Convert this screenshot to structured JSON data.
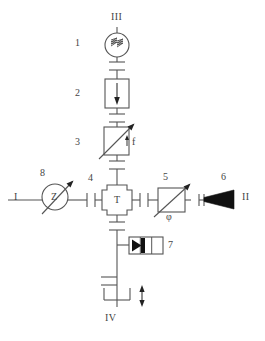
{
  "diagram": {
    "stroke_color": "#555555",
    "fill_black": "#111111",
    "background": "#ffffff",
    "ports": [
      {
        "id": "port-III",
        "label": "III",
        "x": 117,
        "y": 17,
        "position": "top"
      },
      {
        "id": "port-I",
        "label": "I",
        "x": 16,
        "y": 196,
        "position": "left"
      },
      {
        "id": "port-II",
        "label": "II",
        "x": 243,
        "y": 196,
        "position": "right"
      },
      {
        "id": "port-IV",
        "label": "IV",
        "x": 110,
        "y": 317,
        "position": "bottom"
      }
    ],
    "item_numbers": [
      {
        "id": "num-1",
        "label": "1",
        "x": 75,
        "y": 41
      },
      {
        "id": "num-2",
        "label": "2",
        "x": 75,
        "y": 92
      },
      {
        "id": "num-3",
        "label": "3",
        "x": 75,
        "y": 141
      },
      {
        "id": "num-4",
        "label": "4",
        "x": 89,
        "y": 177
      },
      {
        "id": "num-5",
        "label": "5",
        "x": 164,
        "y": 176
      },
      {
        "id": "num-6",
        "label": "6",
        "x": 222,
        "y": 176
      },
      {
        "id": "num-7",
        "label": "7",
        "x": 168,
        "y": 243
      },
      {
        "id": "num-8",
        "label": "8",
        "x": 40,
        "y": 172
      }
    ],
    "symbol_labels": [
      {
        "id": "label-f",
        "label": "f",
        "x": 131,
        "y": 141
      },
      {
        "id": "label-phi",
        "label": "φ",
        "x": 167,
        "y": 216
      },
      {
        "id": "label-T",
        "label": "T",
        "x": 117,
        "y": 199
      },
      {
        "id": "label-Z",
        "label": "Z",
        "x": 55,
        "y": 196
      }
    ],
    "components": [
      {
        "id": "source-circle",
        "name": "wavy-source-symbol",
        "shape": "circle",
        "cx": 117,
        "cy": 45,
        "r": 12
      },
      {
        "id": "detector-box",
        "name": "down-arrow-box",
        "shape": "rect",
        "x": 105,
        "y": 79,
        "w": 24,
        "h": 29
      },
      {
        "id": "filter-box-f",
        "name": "variable-element-f",
        "shape": "rect",
        "x": 104,
        "y": 127,
        "w": 25,
        "h": 28
      },
      {
        "id": "center-cross",
        "name": "cross-junction-T",
        "shape": "cross",
        "cx": 117,
        "cy": 200
      },
      {
        "id": "filter-box-phi",
        "name": "variable-element-phi",
        "shape": "rect",
        "x": 158,
        "y": 188,
        "w": 27,
        "h": 24
      },
      {
        "id": "wedge",
        "name": "tapered-wedge",
        "shape": "wedge",
        "x1": 196,
        "x2": 234,
        "cy": 199
      },
      {
        "id": "triangle-block",
        "name": "triangle-amplifier-block",
        "shape": "rect3",
        "x": 129,
        "y": 237,
        "w": 34,
        "h": 17
      },
      {
        "id": "analyzer-circle",
        "name": "impedance-circle-Z",
        "shape": "circle",
        "cx": 55,
        "cy": 197,
        "r": 13
      },
      {
        "id": "bottom-bracket",
        "name": "bottom-bracket",
        "shape": "bracket",
        "cx": 109,
        "cy": 293
      },
      {
        "id": "vertical-double-arrow",
        "name": "vertical-double-arrow",
        "shape": "arrow2",
        "cx": 139,
        "cy": 295
      }
    ]
  }
}
